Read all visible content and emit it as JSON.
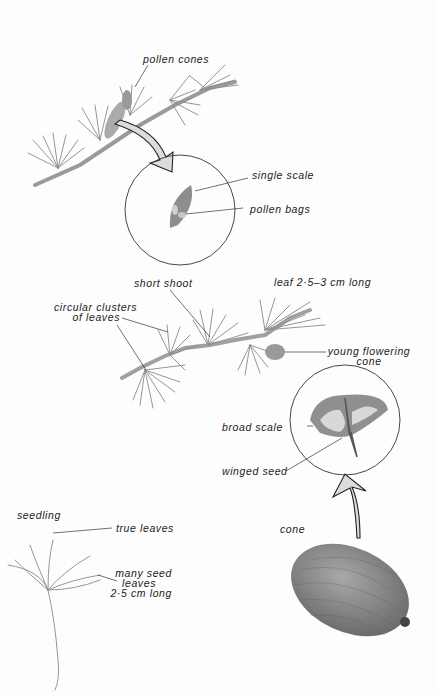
{
  "diagram": {
    "colors": {
      "ink": "#222222",
      "plant": "#8a8a8a",
      "background": "#fdfdfd"
    },
    "panels": {
      "pollen_branch": {
        "labels": {
          "pollen_cones": "pollen cones"
        },
        "inset": {
          "single_scale": "single scale",
          "pollen_bags": "pollen bags"
        }
      },
      "flowering_branch": {
        "labels": {
          "short_shoot": "short shoot",
          "leaf_length": "leaf 2·5–3 cm long",
          "clusters_line1": "circular clusters",
          "clusters_line2": "of leaves",
          "young_cone_line1": "young flowering",
          "young_cone_line2": "cone"
        }
      },
      "seed_inset": {
        "broad_scale": "broad scale",
        "winged_seed": "winged seed"
      },
      "seedling": {
        "title": "seedling",
        "true_leaves": "true leaves",
        "seed_leaves_line1": "many seed",
        "seed_leaves_line2": "leaves",
        "seed_leaves_line3": "2·5 cm long"
      },
      "cone": {
        "title": "cone"
      }
    }
  }
}
